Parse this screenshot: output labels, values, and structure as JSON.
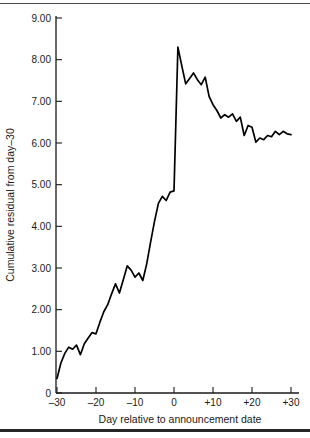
{
  "figure": {
    "top_rule_color": "#4a4a4a",
    "bottom_rule_color": "#262626",
    "background": "#ffffff",
    "line_color": "#000000"
  },
  "chart_data": {
    "type": "line",
    "title": "",
    "xlabel": "Day relative to announcement date",
    "ylabel": "Cumulative residual from day–30",
    "xlim": [
      -30,
      30
    ],
    "ylim": [
      0,
      9
    ],
    "grid": false,
    "legend": null,
    "xticks": [
      -30,
      -20,
      -10,
      0,
      10,
      20,
      30
    ],
    "xticklabels": [
      "–30",
      "–20",
      "–10",
      "0",
      "+10",
      "+20",
      "+30"
    ],
    "yticks": [
      0,
      1,
      2,
      3,
      4,
      5,
      6,
      7,
      8,
      9
    ],
    "yticklabels": [
      "0",
      "1.00",
      "2.00",
      "3.00",
      "4.00",
      "5.00",
      "6.00",
      "7.00",
      "8.00",
      "9.00"
    ],
    "series": [
      {
        "name": "Cumulative residual",
        "x": [
          -30,
          -29,
          -28,
          -27,
          -26,
          -25,
          -24,
          -23,
          -22,
          -21,
          -20,
          -19,
          -18,
          -17,
          -16,
          -15,
          -14,
          -13,
          -12,
          -11,
          -10,
          -9,
          -8,
          -7,
          -6,
          -5,
          -4,
          -3,
          -2,
          -1,
          0,
          1,
          2,
          3,
          4,
          5,
          6,
          7,
          8,
          9,
          10,
          11,
          12,
          13,
          14,
          15,
          16,
          17,
          18,
          19,
          20,
          21,
          22,
          23,
          24,
          25,
          26,
          27,
          28,
          29,
          30
        ],
        "values": [
          0.35,
          0.72,
          0.95,
          1.1,
          1.05,
          1.15,
          0.92,
          1.18,
          1.32,
          1.45,
          1.42,
          1.7,
          1.95,
          2.12,
          2.38,
          2.62,
          2.4,
          2.72,
          3.05,
          2.95,
          2.78,
          2.88,
          2.7,
          3.1,
          3.62,
          4.12,
          4.55,
          4.72,
          4.62,
          4.82,
          4.85,
          8.3,
          7.85,
          7.42,
          7.55,
          7.68,
          7.52,
          7.4,
          7.58,
          7.12,
          6.92,
          6.78,
          6.6,
          6.68,
          6.62,
          6.7,
          6.52,
          6.62,
          6.18,
          6.42,
          6.38,
          6.02,
          6.12,
          6.08,
          6.18,
          6.15,
          6.28,
          6.2,
          6.28,
          6.22,
          6.2
        ]
      }
    ]
  }
}
